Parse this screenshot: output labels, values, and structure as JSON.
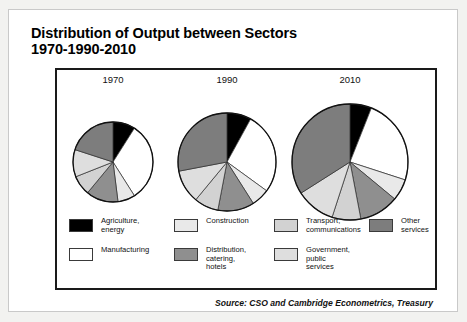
{
  "figure": {
    "title_line1": "Distribution of Output between Sectors",
    "title_line2": "1970-1990-2010",
    "source": "Source: CSO and Cambridge Econometrics, Treasury"
  },
  "legend": {
    "columns": [
      [
        {
          "label": "Agriculture,\nenergy",
          "color": "#000000",
          "icon": "legend-swatch-agriculture"
        },
        {
          "label": "Manufacturing",
          "color": "#ffffff",
          "icon": "legend-swatch-manufacturing"
        }
      ],
      [
        {
          "label": "Construction",
          "color": "#e9e9e9",
          "icon": "legend-swatch-construction"
        },
        {
          "label": "Distribution,\ncatering, hotels",
          "color": "#8f8f8f",
          "icon": "legend-swatch-distribution"
        }
      ],
      [
        {
          "label": "Transport,\ncommunications",
          "color": "#d2d2d2",
          "icon": "legend-swatch-transport"
        },
        {
          "label": "Government,\npublic services",
          "color": "#dedede",
          "icon": "legend-swatch-government"
        }
      ],
      [
        {
          "label": "Other\nservices",
          "color": "#7d7d7d",
          "icon": "legend-swatch-other"
        }
      ]
    ]
  },
  "chart_data": {
    "type": "pie",
    "title": "Distribution of Output between Sectors 1970-1990-2010",
    "subtitle": "",
    "xlabel": "",
    "ylabel": "",
    "legend_position": "bottom",
    "grid": false,
    "units": "percent of total output",
    "note": "Pie radii grow with total output: 1970 smallest, 2010 largest.",
    "categories": [
      "Agriculture, energy",
      "Manufacturing",
      "Construction",
      "Distribution, catering, hotels",
      "Transport, communications",
      "Government, public services",
      "Other services"
    ],
    "colors": [
      "#000000",
      "#ffffff",
      "#e9e9e9",
      "#8f8f8f",
      "#d2d2d2",
      "#dedede",
      "#7d7d7d"
    ],
    "pies": [
      {
        "label": "1970",
        "radius_px": 40,
        "values": [
          9,
          32,
          7,
          13,
          8,
          11,
          20
        ]
      },
      {
        "label": "1990",
        "radius_px": 49,
        "values": [
          8,
          27,
          6,
          12,
          8,
          11,
          28
        ]
      },
      {
        "label": "2010",
        "radius_px": 58,
        "values": [
          6,
          24,
          6,
          11,
          8,
          11,
          34
        ]
      }
    ]
  }
}
